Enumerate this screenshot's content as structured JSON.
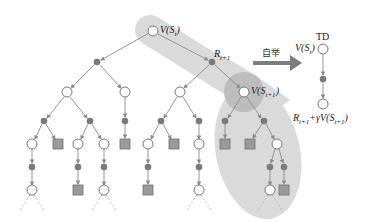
{
  "colors": {
    "edge": "#8a8a8a",
    "chance_fill": "#7a7a7a",
    "terminal_fill": "#9a9a9a",
    "terminal_stroke": "#707070",
    "band": "#d9d9d9",
    "highlight": "#bdbdbd",
    "arrow": "#7d7d7d"
  },
  "labels": {
    "root": "V(S",
    "root_sub": "t",
    "root_close": ")",
    "reward": "R",
    "reward_sub": "t+1",
    "next_state": "V(S",
    "next_state_sub": "t+1",
    "next_state_close": ")",
    "bootstrap": "自举",
    "td_title": "TD",
    "td_state": "V(S",
    "td_state_sub": "t",
    "td_state_close": ")",
    "td_target_r": "R",
    "td_target_r_sub": "t+1",
    "td_target_mid": "+γV(S",
    "td_target_sub": "t+1",
    "td_target_close": ")"
  },
  "tree": {
    "state_nodes": [
      [
        153,
        31
      ],
      [
        67,
        92
      ],
      [
        125,
        92
      ],
      [
        180,
        92
      ],
      [
        244,
        92
      ],
      [
        32,
        144
      ],
      [
        78,
        144
      ],
      [
        104,
        144
      ],
      [
        148,
        144
      ],
      [
        199,
        144
      ],
      [
        277,
        144
      ],
      [
        32,
        190
      ],
      [
        104,
        190
      ],
      [
        199,
        190
      ],
      [
        270,
        190
      ]
    ],
    "chance_nodes": [
      [
        97,
        62
      ],
      [
        212,
        62
      ],
      [
        44,
        121
      ],
      [
        90,
        121
      ],
      [
        125,
        121
      ],
      [
        161,
        121
      ],
      [
        199,
        121
      ],
      [
        225,
        121
      ],
      [
        264,
        121
      ],
      [
        32,
        167
      ],
      [
        78,
        167
      ],
      [
        104,
        167
      ],
      [
        148,
        167
      ],
      [
        199,
        167
      ],
      [
        270,
        167
      ],
      [
        284,
        167
      ]
    ],
    "terminal_nodes": [
      [
        58,
        144
      ],
      [
        125,
        144
      ],
      [
        174,
        144
      ],
      [
        225,
        144
      ],
      [
        250,
        144
      ],
      [
        78,
        190
      ],
      [
        148,
        190
      ],
      [
        284,
        190
      ]
    ]
  }
}
